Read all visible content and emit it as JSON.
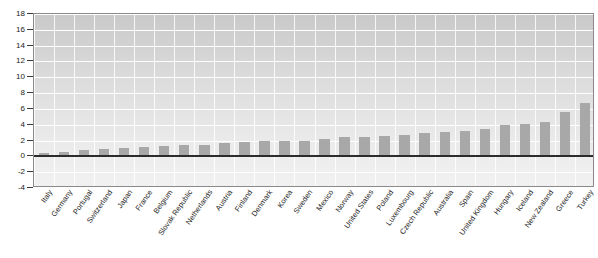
{
  "chart_data": {
    "type": "bar",
    "title": "",
    "subtitle": "",
    "xlabel": "",
    "ylabel": "",
    "ylim": [
      -4,
      18
    ],
    "ytick_step": 2,
    "yticks": [
      "18",
      "16",
      "14",
      "12",
      "10",
      "8",
      "6",
      "4",
      "2",
      "0",
      "-2",
      "-4"
    ],
    "grid": true,
    "legend": "none",
    "bar_color": "#a8a8a8",
    "plot_background": "#dcdcdc",
    "categories": [
      "Italy",
      "Germany",
      "Portugal",
      "Switzerland",
      "Japan",
      "France",
      "Belgium",
      "Slovak Republic",
      "Netherlands",
      "Austria",
      "Finland",
      "Denmark",
      "Korea",
      "Sweden",
      "Mexico",
      "Norway",
      "United States",
      "Poland",
      "Luxembourg",
      "Czech Republic",
      "Australia",
      "Spain",
      "United Kingdom",
      "Hungary",
      "Iceland",
      "New Zealand",
      "Greece",
      "Turkey"
    ],
    "values": [
      0.4,
      0.5,
      0.8,
      0.9,
      1.0,
      1.2,
      1.3,
      1.5,
      1.5,
      1.7,
      1.8,
      1.9,
      2.0,
      2.0,
      2.2,
      2.4,
      2.5,
      2.6,
      2.7,
      2.9,
      3.1,
      3.2,
      3.4,
      4.0,
      4.1,
      4.4,
      5.6,
      6.8
    ]
  }
}
